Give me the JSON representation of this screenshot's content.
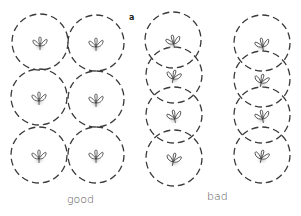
{
  "figure": {
    "panel_label": "a",
    "groups": [
      {
        "label": "good",
        "label_pos": [
          67,
          193
        ],
        "circle_radius": 28,
        "plants": [
          {
            "cx": 40,
            "cy": 42
          },
          {
            "cx": 96,
            "cy": 43
          },
          {
            "cx": 39,
            "cy": 97
          },
          {
            "cx": 96,
            "cy": 99
          },
          {
            "cx": 39,
            "cy": 155
          },
          {
            "cx": 96,
            "cy": 155
          }
        ]
      },
      {
        "label": "bad",
        "label_pos": [
          207,
          190
        ],
        "circle_radius": 28,
        "plants": [
          {
            "cx": 173,
            "cy": 40
          },
          {
            "cx": 174,
            "cy": 75
          },
          {
            "cx": 174,
            "cy": 115
          },
          {
            "cx": 174,
            "cy": 158
          },
          {
            "cx": 262,
            "cy": 43
          },
          {
            "cx": 262,
            "cy": 79
          },
          {
            "cx": 262,
            "cy": 115
          },
          {
            "cx": 262,
            "cy": 155
          }
        ]
      }
    ],
    "colors": {
      "circle_stroke": "#3a3a3a",
      "plant_stroke": "#333333",
      "root_shadow": "#bdbdbd",
      "label_text": "#555555"
    }
  }
}
